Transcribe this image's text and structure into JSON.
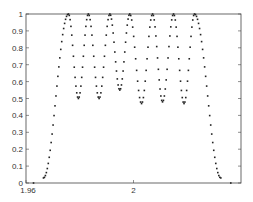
{
  "chart_data": {
    "type": "scatter",
    "title": "",
    "xlabel": "",
    "ylabel": "",
    "xlim": [
      1.96,
      2.04
    ],
    "ylim": [
      0,
      1
    ],
    "grid": false,
    "legend": null,
    "marker": "dot",
    "marker_color": "#222222",
    "x_ticks": [
      {
        "value": 1.96,
        "label": "1.96"
      },
      {
        "value": 2.0,
        "label": "2"
      }
    ],
    "y_ticks": [
      {
        "value": 0,
        "label": "0"
      },
      {
        "value": 0.1,
        "label": "0.1"
      },
      {
        "value": 0.2,
        "label": "0.2"
      },
      {
        "value": 0.3,
        "label": "0.3"
      },
      {
        "value": 0.4,
        "label": "0.4"
      },
      {
        "value": 0.5,
        "label": "0.5"
      },
      {
        "value": 0.6,
        "label": "0.6"
      },
      {
        "value": 0.7,
        "label": "0.7"
      },
      {
        "value": 0.8,
        "label": "0.8"
      },
      {
        "value": 0.9,
        "label": "0.9"
      },
      {
        "value": 1,
        "label": "1"
      }
    ],
    "series": [
      {
        "name": "response",
        "peaks_x": [
          1.9758,
          1.9832,
          1.9912,
          1.9986,
          2.0071,
          2.0149,
          2.0227
        ],
        "peak_value": 1.0,
        "troughs_x": [
          1.9795,
          1.9872,
          1.9949,
          2.003,
          2.0108,
          2.0188
        ],
        "trough_values": [
          0.5,
          0.5,
          0.55,
          0.47,
          0.48,
          0.47
        ],
        "rise_start_x": 1.9665,
        "fall_end_x": 2.0325,
        "floor_points": [
          {
            "x": 1.9628,
            "y": 0.0
          },
          {
            "x": 2.0362,
            "y": 0.0
          }
        ]
      }
    ]
  }
}
